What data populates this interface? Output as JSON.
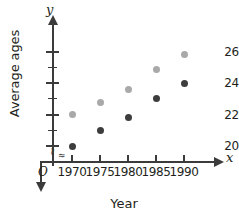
{
  "chart_data": {
    "type": "scatter",
    "title": "",
    "xlabel": "Year",
    "ylabel": "Average ages",
    "x": [
      1970,
      1975,
      1980,
      1985,
      1990
    ],
    "xticklabels": [
      "1970",
      "1975",
      "1980",
      "1985",
      "1990"
    ],
    "yticklabels": [
      "20",
      "22",
      "24",
      "26"
    ],
    "yticks": [
      20,
      22,
      24,
      26
    ],
    "yminorticks": [
      21,
      23,
      25
    ],
    "ylim": [
      19.4,
      26.8
    ],
    "xlim": [
      1967.5,
      1992.5
    ],
    "grid": false,
    "legend": "none",
    "axis_break_x": true,
    "axis_break_y": true,
    "origin_label": "O",
    "x_axis_variable": "x",
    "y_axis_variable": "y",
    "series": [
      {
        "name": "light-series",
        "color": "#a9a9a9",
        "values": [
          22.0,
          22.8,
          23.6,
          24.9,
          25.8
        ]
      },
      {
        "name": "dark-series",
        "color": "#3d3d3d",
        "values": [
          20.0,
          21.0,
          21.8,
          23.0,
          24.0
        ]
      }
    ]
  },
  "colors": {
    "axis": "#3b3b3b",
    "text": "#231f20",
    "series_light": "#a9a9a9",
    "series_dark": "#3d3d3d",
    "background": "#ffffff"
  },
  "icons": {
    "y_axis_arrow": "arrow-up-icon",
    "x_axis_arrow": "arrow-right-icon",
    "axis_break": "axis-break-squiggle-icon"
  }
}
